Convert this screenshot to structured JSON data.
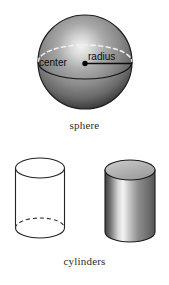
{
  "figure": {
    "background_color": "#ffffff",
    "width": 169,
    "height": 285
  },
  "sphere": {
    "caption": "sphere",
    "labels": {
      "center": "center",
      "radius": "radius"
    },
    "icon_names": {
      "center_point": "center-dot-icon",
      "radius_line": "radius-line-icon",
      "hidden_equator": "dashed-ellipse-icon",
      "equator": "solid-ellipse-icon"
    },
    "geometry": {
      "center_x": 85,
      "center_y": 62,
      "radius": 47
    },
    "colors": {
      "highlight": "#e8e8e8",
      "mid": "#9a9a9a",
      "shadow": "#3a3a3a",
      "outline": "#1a1a1a",
      "dash": "#f0f0f0",
      "label": "#0b0b0b"
    }
  },
  "cylinders": {
    "caption": "cylinders",
    "items": [
      {
        "name": "wireframe-cylinder",
        "style": "outline",
        "hidden_edge": "dashed",
        "colors": {
          "stroke": "#222222",
          "fill": "#ffffff"
        }
      },
      {
        "name": "shaded-cylinder",
        "style": "shaded",
        "hidden_edge": "none",
        "colors": {
          "stroke": "#1a1a1a",
          "top_face": "#b8b8b8",
          "body_dark": "#4a4a4a",
          "body_light": "#f2f2f2",
          "body_mid": "#8c8c8c"
        }
      }
    ]
  }
}
